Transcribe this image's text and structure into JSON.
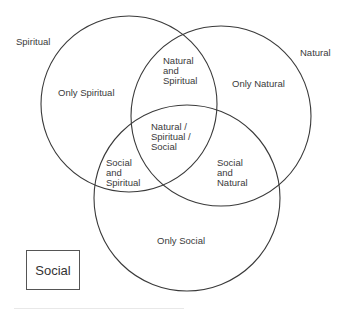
{
  "diagram": {
    "type": "venn",
    "sets": [
      {
        "name": "Spiritual",
        "label": "Spiritual"
      },
      {
        "name": "Natural",
        "label": "Natural"
      },
      {
        "name": "Social",
        "label": "Social"
      }
    ],
    "regions": {
      "only_spiritual": "Only Spiritual",
      "only_natural": "Only Natural",
      "only_social": "Only Social",
      "natural_and_spiritual": [
        "Natural",
        "and",
        "Spiritual"
      ],
      "social_and_spiritual": [
        "Social",
        "and",
        "Spiritual"
      ],
      "social_and_natural": [
        "Social",
        "and",
        "Natural"
      ],
      "all_three": [
        "Natural /",
        "Spiritual /",
        "Social"
      ]
    },
    "legend_box": "Social",
    "colors": {
      "stroke": "#3a3a3a",
      "text": "#333333",
      "background": "#ffffff"
    }
  }
}
